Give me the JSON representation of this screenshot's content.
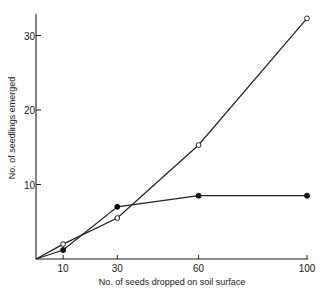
{
  "chart_data": {
    "type": "line",
    "title": "",
    "xlabel": "No. of seeds dropped on soil surface",
    "ylabel": "No. of seedlings emerged",
    "x": [
      10,
      30,
      60,
      100
    ],
    "x_ticks": [
      10,
      30,
      60,
      100
    ],
    "y_ticks": [
      10,
      20,
      30
    ],
    "xlim": [
      0,
      100
    ],
    "ylim": [
      0,
      34
    ],
    "grid": false,
    "legend": null,
    "series": [
      {
        "name": "open circles",
        "marker": "open-circle",
        "values": [
          2.0,
          5.5,
          15.3,
          32.3
        ],
        "starts_at_origin": true
      },
      {
        "name": "filled circles",
        "marker": "filled-circle",
        "values": [
          1.2,
          7.0,
          8.5,
          8.5
        ],
        "starts_at_origin": true
      }
    ]
  },
  "layout": {
    "origin_px": [
      36,
      259
    ],
    "x_px_per_unit": 2.71,
    "y_px_per_unit": 7.45,
    "y_axis_top_px": 14,
    "x_axis_right_px": 308
  }
}
